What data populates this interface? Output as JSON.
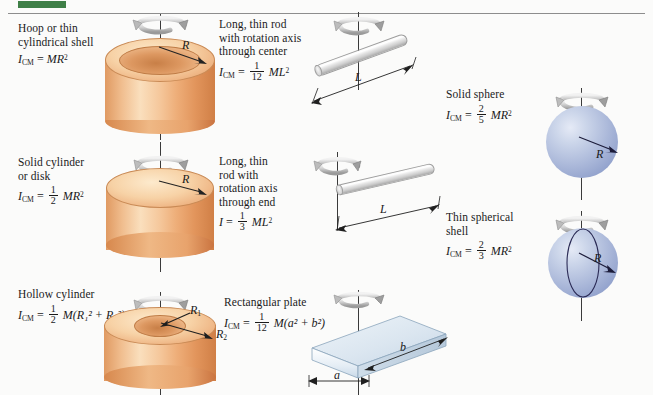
{
  "page": {
    "background": "#fbfbfa",
    "accent_green": "#3f7f47",
    "orange_solid": "#eeae79",
    "blue_sphere": "#aebbdb",
    "blue_plate": "#d6e2ee"
  },
  "entries": [
    {
      "id": "hoop",
      "caption_lines": [
        "Hoop or thin",
        "cylindrical shell"
      ],
      "symbol": "I",
      "subscript": "CM",
      "equals": "=",
      "fraction": null,
      "expression": "MR",
      "exponent": "2",
      "radius_label": "R",
      "shape": "hollow-ring-cylinder",
      "color": "#eeae79"
    },
    {
      "id": "solid-cylinder",
      "caption_lines": [
        "Solid cylinder",
        "or disk"
      ],
      "symbol": "I",
      "subscript": "CM",
      "equals": "=",
      "fraction": {
        "num": "1",
        "den": "2"
      },
      "expression": "MR",
      "exponent": "2",
      "radius_label": "R",
      "shape": "solid-cylinder",
      "color": "#eeae79"
    },
    {
      "id": "hollow-cylinder",
      "caption_lines": [
        "Hollow cylinder"
      ],
      "symbol": "I",
      "subscript": "CM",
      "equals": "=",
      "fraction": {
        "num": "1",
        "den": "2"
      },
      "expression": "M(R₁² + R₂²)",
      "exponent": "",
      "radius_label_inner": "R",
      "radius_sub_inner": "1",
      "radius_label_outer": "R",
      "radius_sub_outer": "2",
      "shape": "thick-walled-cylinder",
      "color": "#eeae79"
    },
    {
      "id": "rod-center",
      "caption_lines": [
        "Long, thin rod",
        "with rotation axis",
        "through center"
      ],
      "symbol": "I",
      "subscript": "CM",
      "equals": "=",
      "fraction": {
        "num": "1",
        "den": "12"
      },
      "expression": "ML",
      "exponent": "2",
      "length_label": "L",
      "shape": "rod",
      "color": "#d8d8d8"
    },
    {
      "id": "rod-end",
      "caption_lines": [
        "Long, thin",
        "rod with",
        "rotation axis",
        "through end"
      ],
      "symbol": "I",
      "subscript": "",
      "equals": "=",
      "fraction": {
        "num": "1",
        "den": "3"
      },
      "expression": "ML",
      "exponent": "2",
      "length_label": "L",
      "shape": "rod",
      "color": "#d8d8d8"
    },
    {
      "id": "rect-plate",
      "caption_lines": [
        "Rectangular plate"
      ],
      "symbol": "I",
      "subscript": "CM",
      "equals": "=",
      "fraction": {
        "num": "1",
        "den": "12"
      },
      "expression": "M(a² + b²)",
      "exponent": "",
      "side_a_label": "a",
      "side_b_label": "b",
      "shape": "plate",
      "color": "#d6e2ee"
    },
    {
      "id": "solid-sphere",
      "caption_lines": [
        "Solid sphere"
      ],
      "symbol": "I",
      "subscript": "CM",
      "equals": "=",
      "fraction": {
        "num": "2",
        "den": "5"
      },
      "expression": "MR",
      "exponent": "2",
      "radius_label": "R",
      "shape": "sphere",
      "color": "#aebbdb"
    },
    {
      "id": "spherical-shell",
      "caption_lines": [
        "Thin spherical",
        "shell"
      ],
      "symbol": "I",
      "subscript": "CM",
      "equals": "=",
      "fraction": {
        "num": "2",
        "den": "3"
      },
      "expression": "MR",
      "exponent": "2",
      "radius_label": "R",
      "shape": "sphere-shell",
      "color": "#aebbdb"
    }
  ],
  "icons": {
    "rotation_arrow": "rotation-arrow-icon",
    "radius_arrow": "radius-arrow-icon",
    "dimension_arrow": "dimension-arrow-icon"
  }
}
